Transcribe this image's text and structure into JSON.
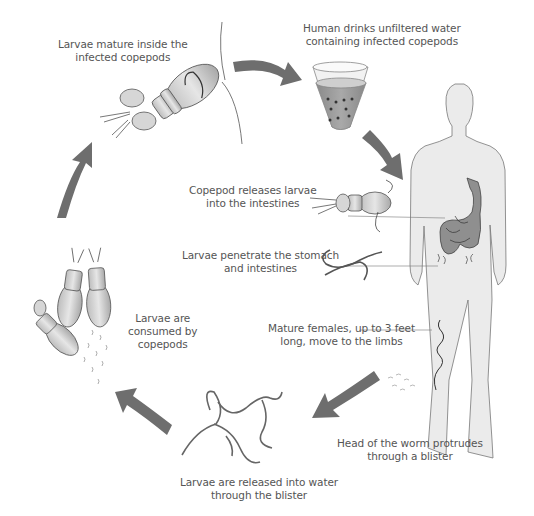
{
  "diagram": {
    "colors": {
      "arrow": "#6e6e6e",
      "body_fill": "#ebebeb",
      "body_outline": "#777777",
      "organ_fill": "#8f8f8f",
      "water": "#9a9a9a",
      "label_text": "#555555"
    },
    "steps": [
      {
        "id": "mature",
        "lines": [
          "Larvae mature inside the",
          "infected copepods"
        ]
      },
      {
        "id": "drink",
        "lines": [
          "Human drinks unfiltered water",
          "containing infected copepods"
        ]
      },
      {
        "id": "release",
        "lines": [
          "Copepod releases larvae",
          "into the intestines"
        ]
      },
      {
        "id": "penetrate",
        "lines": [
          "Larvae penetrate the stomach",
          "and intestines"
        ]
      },
      {
        "id": "females",
        "lines": [
          "Mature females, up to 3 feet",
          "long, move to the limbs"
        ]
      },
      {
        "id": "blister",
        "lines": [
          "Head of the worm protrudes",
          "through a blister"
        ]
      },
      {
        "id": "water",
        "lines": [
          "Larvae are released into water",
          "through the blister"
        ]
      },
      {
        "id": "consumed",
        "lines": [
          "Larvae are",
          "consumed by",
          "copepods"
        ]
      }
    ],
    "cycle_arrows": [
      {
        "name": "arrow-mature-to-drink",
        "direction": "right"
      },
      {
        "name": "arrow-drink-to-human",
        "direction": "down-right"
      },
      {
        "name": "arrow-limb-to-water",
        "direction": "down-left"
      },
      {
        "name": "arrow-water-to-copepods",
        "direction": "up-left"
      },
      {
        "name": "arrow-copepods-to-mature",
        "direction": "up"
      }
    ]
  }
}
